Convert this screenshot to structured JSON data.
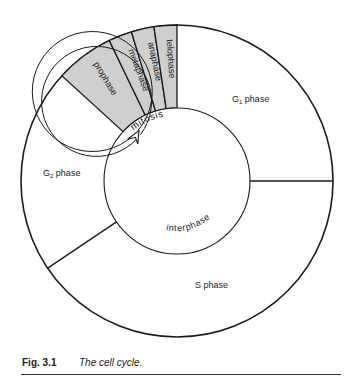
{
  "diagram": {
    "title": "The cell cycle",
    "colors": {
      "mitosis_fill": "#cfcfcf",
      "stroke": "#1a1a1a",
      "background": "#ffffff"
    },
    "phases": {
      "g1": {
        "prefix": "G",
        "subscript": "1",
        "suffix": " phase"
      },
      "g2": {
        "prefix": "G",
        "subscript": "2",
        "suffix": " phase"
      },
      "s": "S phase",
      "mitosis_stages": [
        "prophase",
        "metaphase",
        "anaphase",
        "telophase"
      ]
    },
    "ring_labels": {
      "mitosis": "mitosis",
      "interphase": "interphase"
    }
  },
  "caption": {
    "number": "Fig. 3.1",
    "text": "The cell cycle."
  }
}
